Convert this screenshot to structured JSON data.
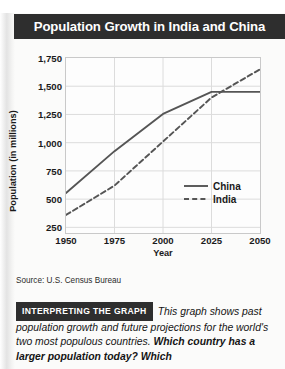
{
  "title": "Population Growth in India and China",
  "source": "Source: U.S. Census Bureau",
  "caption": {
    "badge": "INTERPRETING THE GRAPH",
    "text_plain": "This graph shows past population growth and future projections for the world's two most populous countries. ",
    "text_bold": "Which country has a larger population today? Which"
  },
  "colors": {
    "banner": "#2e2e2e",
    "banner_text": "#ffffff",
    "line": "#555555",
    "grid": "#dcdcdc",
    "plot_border": "#c9c9c9",
    "page": "#fbfbfa"
  },
  "chart_data": {
    "type": "line",
    "title": "Population Growth in India and China",
    "xlabel": "Year",
    "ylabel": "Population (in millions)",
    "x": [
      1950,
      1975,
      2000,
      2025,
      2050
    ],
    "xlim": [
      1950,
      2050
    ],
    "ylim": [
      200,
      1750
    ],
    "xticks": [
      "1950",
      "1975",
      "2000",
      "2025",
      "2050"
    ],
    "yticks": [
      "250",
      "500",
      "750",
      "1,000",
      "1,250",
      "1,500",
      "1,750"
    ],
    "ytick_values": [
      250,
      500,
      750,
      1000,
      1250,
      1500,
      1750
    ],
    "grid": true,
    "legend_position": "lower right",
    "series": [
      {
        "name": "China",
        "style": "solid",
        "values": [
          555,
          925,
          1255,
          1450,
          1450
        ]
      },
      {
        "name": "India",
        "style": "dashed",
        "values": [
          360,
          620,
          1010,
          1400,
          1650
        ]
      }
    ]
  }
}
